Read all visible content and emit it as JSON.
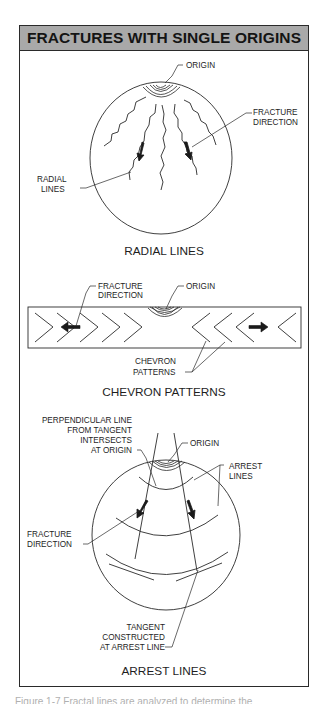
{
  "figure": {
    "title": "FRACTURES WITH SINGLE ORIGINS",
    "colors": {
      "header_bg": "#a9a9a9",
      "line": "#2a2a2a",
      "text": "#1e1e1e",
      "background": "#ffffff"
    },
    "panels": [
      {
        "id": "radial",
        "title": "RADIAL LINES",
        "labels": {
          "origin": "ORIGIN",
          "fracture_direction": [
            "FRACTURE",
            "DIRECTION"
          ],
          "radial_lines": [
            "RADIAL",
            "LINES"
          ]
        }
      },
      {
        "id": "chevron",
        "title": "CHEVRON PATTERNS",
        "labels": {
          "fracture_direction": [
            "FRACTURE",
            "DIRECTION"
          ],
          "origin": "ORIGIN",
          "chevron_patterns": [
            "CHEVRON",
            "PATTERNS"
          ]
        }
      },
      {
        "id": "arrest",
        "title": "ARREST LINES",
        "labels": {
          "perpendicular": [
            "PERPENDICULAR LINE",
            "FROM TANGENT",
            "INTERSECTS",
            "AT ORIGIN"
          ],
          "origin": "ORIGIN",
          "arrest_lines": [
            "ARREST",
            "LINES"
          ],
          "fracture_direction": [
            "FRACTURE",
            "DIRECTION"
          ],
          "tangent": [
            "TANGENT",
            "CONSTRUCTED",
            "AT ARREST LINE"
          ]
        }
      }
    ],
    "caption_partial": "Figure 1-7  Fractal lines are analyzed to determine the"
  }
}
